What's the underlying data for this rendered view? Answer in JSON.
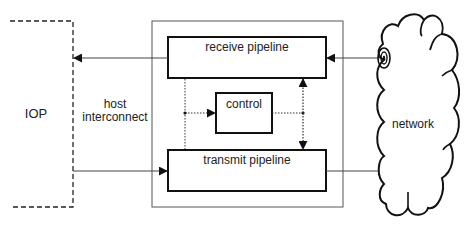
{
  "diagram": {
    "iop": {
      "label": "IOP"
    },
    "host_interconnect": {
      "line1": "host",
      "line2": "interconnect"
    },
    "receive_pipeline": {
      "label": "receive pipeline"
    },
    "control": {
      "label": "control"
    },
    "transmit_pipeline": {
      "label": "transmit pipeline"
    },
    "network": {
      "label": "network"
    },
    "colors": {
      "line": "#111111",
      "thin_line": "#444444",
      "background": "#ffffff"
    }
  }
}
